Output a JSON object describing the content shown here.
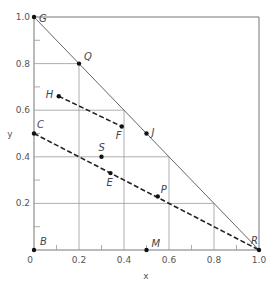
{
  "chart_data": {
    "type": "scatter",
    "title": "",
    "xlabel": "x",
    "ylabel": "y",
    "xlim": [
      0,
      1.0
    ],
    "ylim": [
      0,
      1.0
    ],
    "x_ticks": [
      "0",
      "0.2",
      "0.4",
      "0.6",
      "0.8",
      "1.0"
    ],
    "y_ticks": [
      "0.2",
      "0.4",
      "0.6",
      "0.8",
      "1.0"
    ],
    "grid": "triangular (lines under hypotenuse only)",
    "points": [
      {
        "label": "G",
        "x": 0.0,
        "y": 1.0
      },
      {
        "label": "Q",
        "x": 0.2,
        "y": 0.8
      },
      {
        "label": "H",
        "x": 0.11,
        "y": 0.66
      },
      {
        "label": "F",
        "x": 0.39,
        "y": 0.53
      },
      {
        "label": "J",
        "x": 0.5,
        "y": 0.5
      },
      {
        "label": "C",
        "x": 0.0,
        "y": 0.5
      },
      {
        "label": "S",
        "x": 0.3,
        "y": 0.4
      },
      {
        "label": "E",
        "x": 0.34,
        "y": 0.33
      },
      {
        "label": "P",
        "x": 0.55,
        "y": 0.23
      },
      {
        "label": "B",
        "x": 0.0,
        "y": 0.0
      },
      {
        "label": "M",
        "x": 0.5,
        "y": 0.0
      },
      {
        "label": "R",
        "x": 1.0,
        "y": 0.0
      }
    ],
    "lines": [
      {
        "name": "hypotenuse G-R",
        "style": "solid",
        "from": [
          0.0,
          1.0
        ],
        "to": [
          1.0,
          0.0
        ]
      },
      {
        "name": "tie line H-F",
        "style": "dashed",
        "from": [
          0.11,
          0.66
        ],
        "to": [
          0.39,
          0.53
        ]
      },
      {
        "name": "tie line C-R",
        "style": "dashed",
        "from": [
          0.0,
          0.5
        ],
        "to": [
          1.0,
          0.0
        ]
      }
    ]
  }
}
